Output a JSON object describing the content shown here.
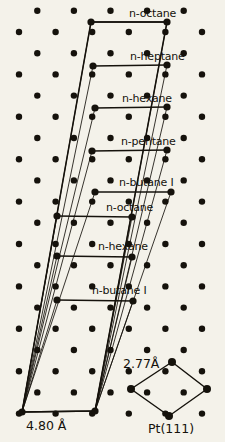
{
  "figure": {
    "title_visible": false,
    "background_color": "#f4f2ea",
    "ink_color": "#15120c",
    "substrate_label": "Pt(111)",
    "substrate_nn_distance": "2.77Å",
    "cell_width_label": "4.80 Å",
    "angstrom_symbol": "Å"
  },
  "chart_data": {
    "type": "diagram",
    "title": "",
    "xlabel": "",
    "ylabel": "",
    "substrate": "Pt(111)",
    "lattice_constant": "2.77Å",
    "unit_cell_width": "4.80 Å",
    "adsorbate_labels": [
      "n-octane",
      "n-heptane",
      "n-hexane",
      "n-pentane",
      "n-butane I",
      "n-octane",
      "n-hexane",
      "n-butane I"
    ]
  },
  "molecules": [
    {
      "id": 0,
      "label": "n-octane",
      "x1": 91,
      "y1": 22,
      "x2": 167,
      "y2": 22,
      "label_x": 129,
      "label_y": 17
    },
    {
      "id": 1,
      "label": "n-heptane",
      "x1": 93,
      "y1": 66,
      "x2": 167,
      "y2": 65,
      "label_x": 130,
      "label_y": 60
    },
    {
      "id": 2,
      "label": "n-hexane",
      "x1": 95,
      "y1": 108,
      "x2": 167,
      "y2": 107,
      "label_x": 122,
      "label_y": 102
    },
    {
      "id": 3,
      "label": "n-pentane",
      "x1": 92,
      "y1": 151,
      "x2": 167,
      "y2": 150,
      "label_x": 121,
      "label_y": 145
    },
    {
      "id": 4,
      "label": "n-butane I",
      "x1": 95,
      "y1": 192,
      "x2": 171,
      "y2": 192,
      "label_x": 119,
      "label_y": 186
    },
    {
      "id": 5,
      "label": "n-octane",
      "x1": 57,
      "y1": 216,
      "x2": 132,
      "y2": 217,
      "label_x": 106,
      "label_y": 211
    },
    {
      "id": 6,
      "label": "n-hexane",
      "x1": 57,
      "y1": 256,
      "x2": 132,
      "y2": 257,
      "label_x": 98,
      "label_y": 250
    },
    {
      "id": 7,
      "label": "n-butane I",
      "x1": 57,
      "y1": 300,
      "x2": 133,
      "y2": 301,
      "label_x": 92,
      "label_y": 294
    }
  ],
  "unit_cell": {
    "top_left_x": 91,
    "top_left_y": 22,
    "top_right_x": 167,
    "top_right_y": 22,
    "bottom_left_x": 22,
    "bottom_left_y": 412,
    "bottom_right_x": 95,
    "bottom_right_y": 411
  },
  "dimension_bar": {
    "x1": 22,
    "y1": 412,
    "x2": 95,
    "y2": 411,
    "label": "4.80 Å",
    "label_x": 26,
    "label_y": 430
  },
  "pt_cell": {
    "label": "Pt(111)",
    "label_x": 148,
    "label_y": 433,
    "distance_label": "2.77Å",
    "distance_label_x": 123,
    "distance_label_y": 368,
    "top_x": 172,
    "top_y": 362,
    "left_x": 131,
    "left_y": 389,
    "right_x": 207,
    "right_y": 389,
    "bottom_x": 169,
    "bottom_y": 416
  },
  "lattice_dots": [
    {
      "x": 56,
      "y": 32
    },
    {
      "x": 203,
      "y": 32
    },
    {
      "x": 58,
      "y": 74
    },
    {
      "x": 203,
      "y": 74
    },
    {
      "x": 58,
      "y": 117
    },
    {
      "x": 203,
      "y": 117
    },
    {
      "x": 57,
      "y": 160
    },
    {
      "x": 203,
      "y": 160
    },
    {
      "x": 19,
      "y": 182
    },
    {
      "x": 203,
      "y": 203
    },
    {
      "x": 22,
      "y": 224
    },
    {
      "x": 95,
      "y": 238
    },
    {
      "x": 22,
      "y": 266
    },
    {
      "x": 95,
      "y": 281
    },
    {
      "x": 168,
      "y": 281
    },
    {
      "x": 20,
      "y": 308
    },
    {
      "x": 94,
      "y": 323
    },
    {
      "x": 168,
      "y": 323
    },
    {
      "x": 20,
      "y": 350
    },
    {
      "x": 94,
      "y": 350
    },
    {
      "x": 168,
      "y": 350
    },
    {
      "x": 22,
      "y": 372
    },
    {
      "x": 58,
      "y": 391
    },
    {
      "x": 129,
      "y": 149
    },
    {
      "x": 58,
      "y": 203
    },
    {
      "x": 131,
      "y": 191
    }
  ]
}
